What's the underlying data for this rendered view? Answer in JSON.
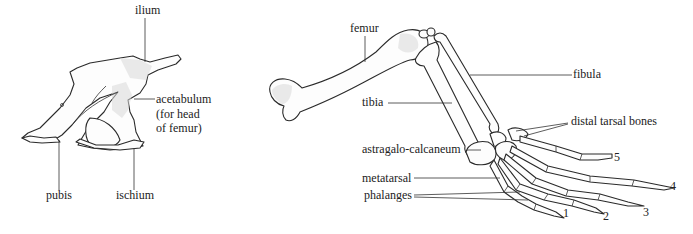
{
  "pelvis": {
    "labels": {
      "ilium": "ilium",
      "acetabulum_line1": "acetabulum",
      "acetabulum_line2": "(for head",
      "acetabulum_line3": "of femur)",
      "pubis": "pubis",
      "ischium": "ischium"
    }
  },
  "hindlimb": {
    "labels": {
      "femur": "femur",
      "fibula": "fibula",
      "tibia": "tibia",
      "distal_tarsal": "distal tarsal bones",
      "astragalo": "astragalo-calcaneum",
      "metatarsal": "metatarsal",
      "phalanges": "phalanges"
    },
    "digits": [
      "1",
      "2",
      "3",
      "4",
      "5"
    ]
  }
}
